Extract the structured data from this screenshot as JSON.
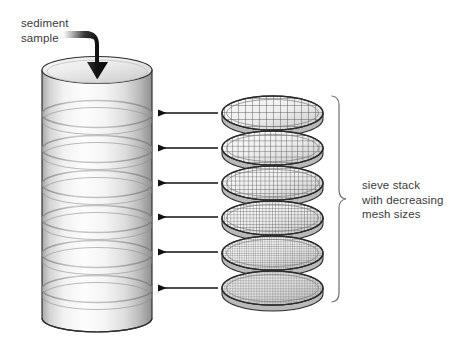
{
  "figure": {
    "background_color": "#ffffff",
    "width": 463,
    "height": 353
  },
  "labels": {
    "sediment_sample": "sediment\nsample",
    "sieve_stack": "sieve stack\nwith decreasing\nmesh sizes",
    "text_color": "#3b3b3b"
  },
  "column": {
    "name": "sieve-column",
    "segment_count": 7,
    "top_y": 58,
    "bottom_y": 331,
    "left_x": 42,
    "right_x": 152,
    "fill_light": "#fcfcfc",
    "fill_mid": "#e3e3e3",
    "fill_dark": "#9d9d9d",
    "outline_color": "#2b2b2b"
  },
  "sieves": {
    "count": 6,
    "left_x": 222,
    "right_x": 323,
    "mesh_color": "#4a4a4a",
    "rim_color": "#2b2b2b",
    "items": [
      {
        "index": 1,
        "center_y": 113,
        "mesh_spacing": 7.0,
        "mesh_label": "coarsest"
      },
      {
        "index": 2,
        "center_y": 148,
        "mesh_spacing": 5.4,
        "mesh_label": "coarse"
      },
      {
        "index": 3,
        "center_y": 183,
        "mesh_spacing": 4.2,
        "mesh_label": "medium-coarse"
      },
      {
        "index": 4,
        "center_y": 218,
        "mesh_spacing": 3.2,
        "mesh_label": "medium-fine"
      },
      {
        "index": 5,
        "center_y": 253,
        "mesh_spacing": 2.3,
        "mesh_label": "fine"
      },
      {
        "index": 6,
        "center_y": 288,
        "mesh_spacing": 1.6,
        "mesh_label": "finest"
      }
    ]
  },
  "arrows": {
    "name": "sieve-to-column-arrows",
    "count": 6,
    "color": "#111111",
    "start_x": 218,
    "end_x": 157,
    "y_positions": [
      113,
      148,
      183,
      217,
      252,
      288
    ]
  },
  "pour_arrow": {
    "name": "sediment-pour-arrow",
    "color": "#111111",
    "direction": "down",
    "tip_y": 78,
    "tip_x": 97
  },
  "brace": {
    "name": "sieve-stack-brace",
    "color": "#6e6e6e",
    "top_y": 95,
    "bottom_y": 303,
    "x": 339
  }
}
